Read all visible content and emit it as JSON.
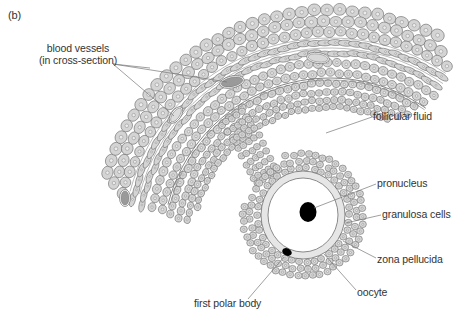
{
  "panel_label": "(b)",
  "labels": {
    "blood_vessels_line1": "blood vessels",
    "blood_vessels_line2": "(in cross-section)",
    "follicular_fluid": "follicular fluid",
    "pronucleus": "pronucleus",
    "granulosa_cells": "granulosa cells",
    "zona_pellucida": "zona pellucida",
    "oocyte": "oocyte",
    "first_polar_body": "first polar body"
  },
  "colors": {
    "cell_fill": "#d4d4d4",
    "cell_stroke": "#6e6e6e",
    "nucleus": "#8a8a8a",
    "line": "#777777",
    "vessel_fill": "#9a9a9a",
    "text": "#333333",
    "zona": "#e6e6e6",
    "dark": "#000000"
  }
}
